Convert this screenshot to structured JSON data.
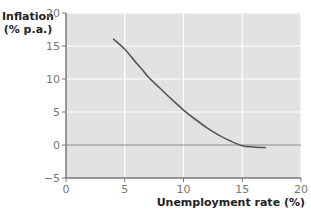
{
  "chart_data": {
    "type": "line",
    "title": "",
    "xlabel": "Unemployment rate (%)",
    "ylabel_line1": "Inflation",
    "ylabel_line2": "(% p.a.)",
    "xlim": [
      0,
      20
    ],
    "ylim": [
      -5,
      20
    ],
    "xticks": [
      0,
      5,
      10,
      15,
      20
    ],
    "yticks": [
      -5,
      0,
      5,
      10,
      15,
      20
    ],
    "xtick_labels": [
      "0",
      "5",
      "10",
      "15",
      "20"
    ],
    "ytick_labels": [
      "−5",
      "0",
      "5",
      "10",
      "15",
      "20"
    ],
    "grid": true,
    "legend": null,
    "colors": {
      "plot_bg": "#e2e2e2",
      "grid": "#ffffff",
      "curve": "#555555",
      "zero_line": "#8a8a8a",
      "axis": "#777777"
    },
    "series": [
      {
        "name": "Phillips curve",
        "x": [
          4,
          5,
          6,
          6.5,
          7,
          8,
          9,
          10,
          11,
          12,
          13,
          14,
          15,
          16,
          17
        ],
        "y": [
          16.1,
          14.5,
          12.4,
          11.4,
          10.3,
          8.6,
          6.9,
          5.3,
          3.9,
          2.6,
          1.5,
          0.6,
          -0.1,
          -0.3,
          -0.4
        ]
      }
    ]
  }
}
